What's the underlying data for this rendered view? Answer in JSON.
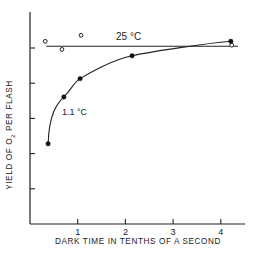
{
  "chart_data": {
    "type": "line",
    "title": "",
    "xlabel": "DARK TIME IN TENTHS OF A SECOND",
    "ylabel": "YIELD OF O2 PER FLASH",
    "ylabel_parts": {
      "pre": "YIELD OF O",
      "sub": "2",
      "post": " PER FLASH"
    },
    "xlim": [
      0,
      4.5
    ],
    "ylim": [
      0,
      6.2
    ],
    "x_ticks": [
      1,
      2,
      3,
      4
    ],
    "x_tick_labels": [
      "1",
      "2",
      "3",
      "4"
    ],
    "y_ticks": [
      1,
      2,
      3,
      4,
      5
    ],
    "y_tick_labels": [
      "",
      "",
      "",
      "",
      ""
    ],
    "grid": false,
    "legend": "inline labels",
    "series": [
      {
        "name": "25 °C",
        "label": "25 °C",
        "marker": "open-circle",
        "x": [
          0.32,
          0.67,
          1.07,
          4.23
        ],
        "y": [
          5.19,
          4.96,
          5.36,
          5.08
        ],
        "fit": {
          "type": "horizontal",
          "y": 5.05,
          "x_range": [
            0.34,
            4.36
          ]
        }
      },
      {
        "name": "1.1 °C",
        "label": "1.1 °C",
        "marker": "filled-circle",
        "x": [
          0.38,
          0.71,
          1.05,
          2.14,
          4.21
        ],
        "y": [
          2.28,
          3.61,
          4.13,
          4.78,
          5.19
        ],
        "fit": {
          "type": "smooth-curve"
        }
      }
    ]
  }
}
